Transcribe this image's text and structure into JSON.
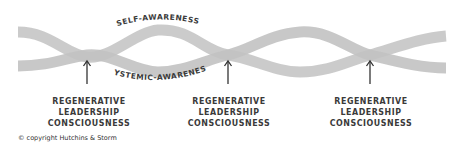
{
  "diagram": {
    "top_band_label": "SELF-AWARENESS",
    "bottom_band_label": "SYSTEMIC-AWARENESS",
    "crossing_labels": [
      {
        "line1": "REGENERATIVE",
        "line2": "LEADERSHIP",
        "line3": "CONSCIOUSNESS"
      },
      {
        "line1": "REGENERATIVE",
        "line2": "LEADERSHIP",
        "line3": "CONSCIOUSNESS"
      },
      {
        "line1": "REGENERATIVE",
        "line2": "LEADERSHIP",
        "line3": "CONSCIOUSNESS"
      }
    ],
    "colors": {
      "band": "#c9c9c9",
      "band_shade": "#b5b5b5",
      "text": "#3a3a3a",
      "arrow": "#333333"
    }
  },
  "footer": {
    "copyright": "© copyright Hutchins & Storm"
  }
}
